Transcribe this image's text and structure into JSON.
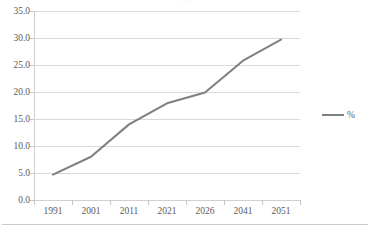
{
  "chart_data": {
    "type": "line",
    "title": "",
    "xlabel": "",
    "ylabel": "",
    "categories": [
      "1991",
      "2001",
      "2011",
      "2021",
      "2026",
      "2041",
      "2051"
    ],
    "series": [
      {
        "name": "%",
        "values": [
          4.7,
          8.0,
          14.0,
          17.9,
          19.9,
          25.8,
          29.7
        ],
        "color": "#808080"
      }
    ],
    "ylim": [
      0.0,
      35.0
    ],
    "ytick_step": 5.0,
    "ytick_labels": [
      "35.0",
      "30.0",
      "25.0",
      "20.0",
      "15.0",
      "10.0",
      "5.0",
      "0.0"
    ],
    "ytick_values": [
      35.0,
      30.0,
      25.0,
      20.0,
      15.0,
      10.0,
      5.0,
      0.0
    ],
    "grid": true,
    "grid_axis": "y",
    "grid_color": "#d9d9d9",
    "legend": true,
    "legend_position": "right",
    "legend_entries": [
      "%"
    ],
    "axis_color": "#d0d0d0",
    "text_color": "#5a5a5a",
    "background": "#ffffff"
  },
  "title_fragment": "· · ·",
  "legend": {
    "entry_label": "%"
  }
}
